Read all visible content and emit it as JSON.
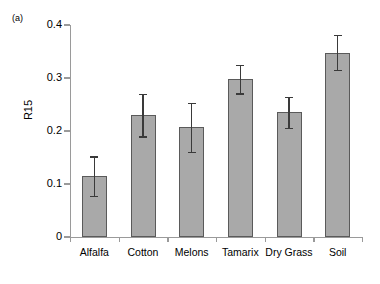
{
  "figure": {
    "panel_tag": "(a)"
  },
  "chart_data": {
    "type": "bar",
    "title": "",
    "xlabel": "",
    "ylabel": "R15",
    "ylim": [
      0,
      0.4
    ],
    "ytick_labels": [
      "0",
      "0.1",
      "0.2",
      "0.3",
      "0.4"
    ],
    "ytick_values": [
      0,
      0.1,
      0.2,
      0.3,
      0.4
    ],
    "grid": false,
    "legend": null,
    "categories": [
      "Alfalfa",
      "Cotton",
      "Melons",
      "Tamarix",
      "Dry Grass",
      "Soil"
    ],
    "values": [
      0.115,
      0.23,
      0.207,
      0.298,
      0.235,
      0.348
    ],
    "errors": [
      0.037,
      0.04,
      0.046,
      0.027,
      0.029,
      0.033
    ],
    "bar_color": "#a9a9a9",
    "bar_edge_color": "#5a5a5a",
    "error_color": "#3a3a3a",
    "axis_color": "#9a9a9a"
  }
}
